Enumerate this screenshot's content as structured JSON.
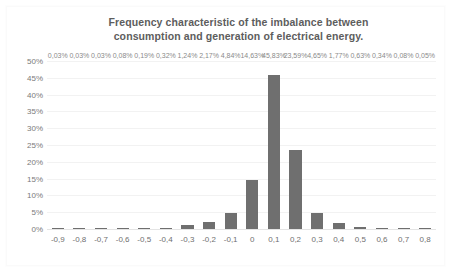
{
  "chart_data": {
    "type": "bar",
    "title": "Frequency characteristic of the imbalance between consumption and generation of electrical energy.",
    "title_lines": [
      "Frequency characteristic of the imbalance between",
      "consumption and generation of electrical energy."
    ],
    "xlabel": "",
    "ylabel": "",
    "grid": true,
    "legend": "none",
    "ylim": [
      0,
      50
    ],
    "y_ticks": [
      "0%",
      "5%",
      "10%",
      "15%",
      "20%",
      "25%",
      "30%",
      "35%",
      "40%",
      "45%",
      "50%"
    ],
    "y_tick_values": [
      0,
      5,
      10,
      15,
      20,
      25,
      30,
      35,
      40,
      45,
      50
    ],
    "categories": [
      "-0,9",
      "-0,8",
      "-0,7",
      "-0,6",
      "-0,5",
      "-0,4",
      "-0,3",
      "-0,2",
      "-0,1",
      "0",
      "0,1",
      "0,2",
      "0,3",
      "0,4",
      "0,5",
      "0,6",
      "0,7",
      "0,8"
    ],
    "values": [
      0.03,
      0.03,
      0.03,
      0.08,
      0.19,
      0.32,
      1.24,
      2.17,
      4.84,
      14.63,
      45.83,
      23.59,
      4.65,
      1.77,
      0.63,
      0.34,
      0.08,
      0.05
    ],
    "data_labels": [
      "0,03%",
      "0,03%",
      "0,03%",
      "0,08%",
      "0,19%",
      "0,32%",
      "1,24%",
      "2,17%",
      "4,84%",
      "14,63%",
      "45,83%",
      "23,59%",
      "4,65%",
      "1,77%",
      "0,63%",
      "0,34%",
      "0,08%",
      "0,05%"
    ],
    "colors": {
      "bar": "#6f6f6f",
      "title": "#5d5d5d",
      "tick_label": "#6f6f6f",
      "data_label": "#8a8a8a",
      "gridline": "#f2f2f2",
      "background": "#ffffff"
    }
  }
}
